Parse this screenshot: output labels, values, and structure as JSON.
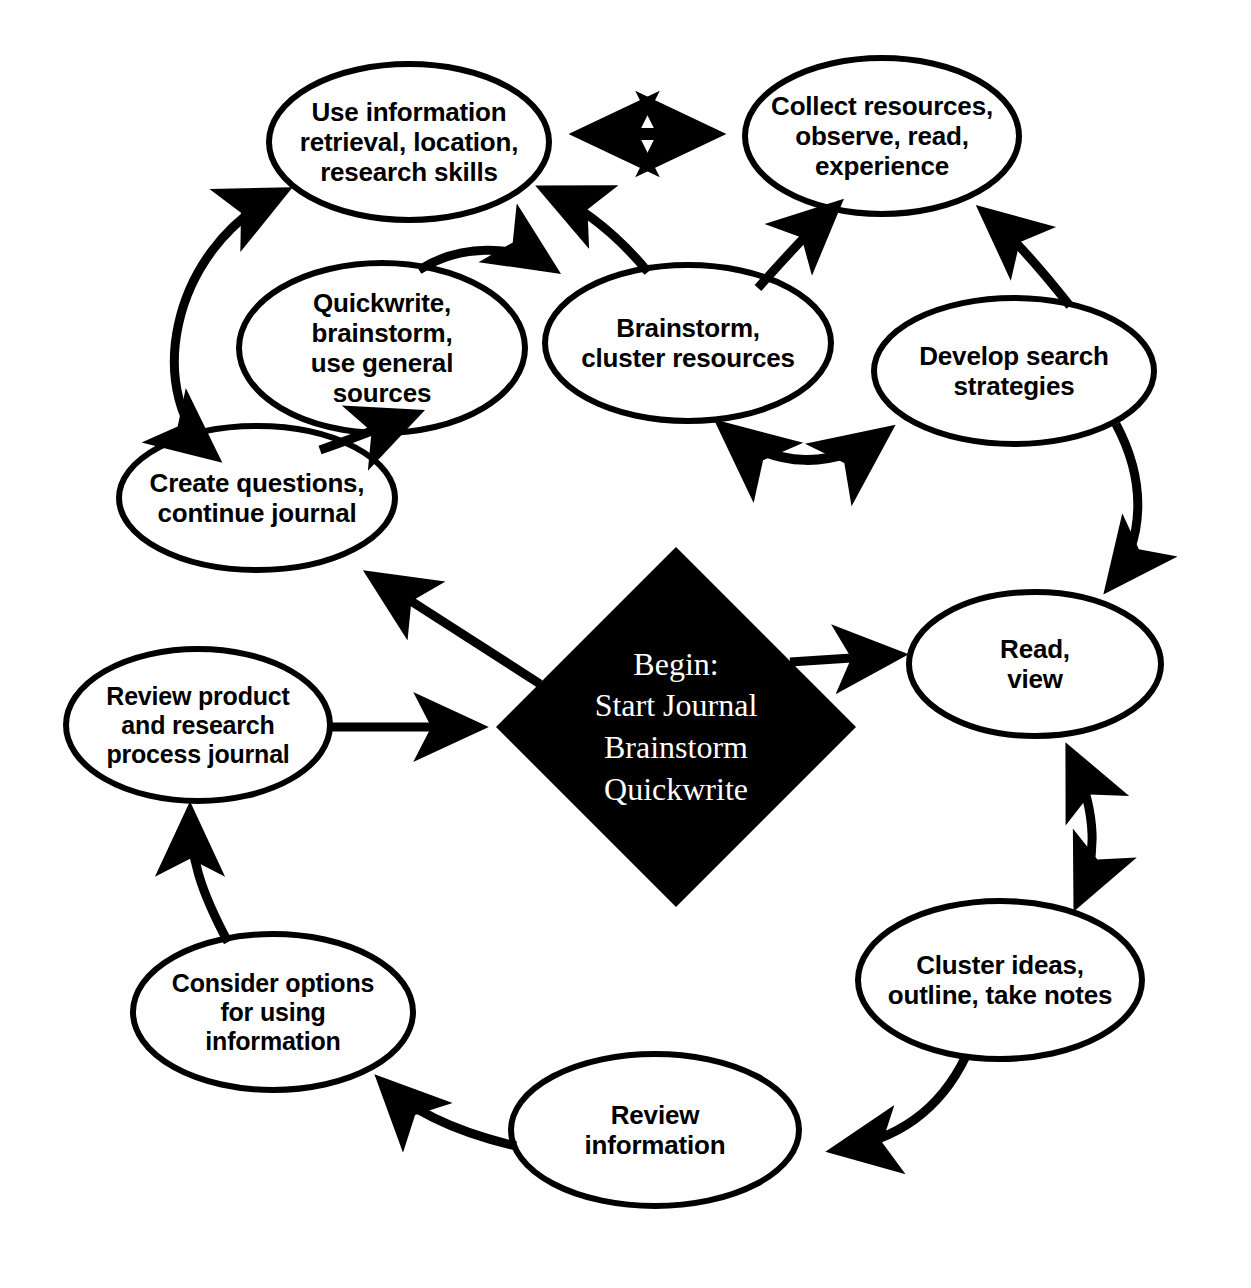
{
  "diagram": {
    "type": "cycle-flowchart",
    "background_color": "#ffffff",
    "stroke_color": "#000000",
    "center": {
      "shape": "diamond",
      "fill_color": "#000000",
      "text_color": "#ffffff",
      "lines": [
        "Begin:",
        "Start Journal",
        "Brainstorm",
        "Quickwrite"
      ],
      "text": "Begin:\nStart Journal\nBrainstorm\nQuickwrite"
    },
    "nodes": [
      {
        "id": "use-information",
        "text": "Use information\nretrieval, location,\nresearch skills",
        "lines": [
          "Use information",
          "retrieval, location,",
          "research skills"
        ],
        "shape": "ellipse",
        "cx": 409,
        "cy": 142,
        "rx": 140,
        "ry": 78
      },
      {
        "id": "collect-resources",
        "text": "Collect resources,\nobserve, read,\nexperience",
        "lines": [
          "Collect resources,",
          "observe, read,",
          "experience"
        ],
        "shape": "ellipse",
        "cx": 882,
        "cy": 136,
        "rx": 137,
        "ry": 78
      },
      {
        "id": "quickwrite",
        "text": "Quickwrite,\nbrainstorm,\nuse general\nsources",
        "lines": [
          "Quickwrite,",
          "brainstorm,",
          "use general",
          "sources"
        ],
        "shape": "ellipse",
        "cx": 382,
        "cy": 348,
        "rx": 143,
        "ry": 85
      },
      {
        "id": "brainstorm-cluster",
        "text": "Brainstorm,\ncluster resources",
        "lines": [
          "Brainstorm,",
          "cluster resources"
        ],
        "shape": "ellipse",
        "cx": 688,
        "cy": 343,
        "rx": 143,
        "ry": 78
      },
      {
        "id": "develop-search",
        "text": "Develop search\nstrategies",
        "lines": [
          "Develop search",
          "strategies"
        ],
        "shape": "ellipse",
        "cx": 1014,
        "cy": 371,
        "rx": 140,
        "ry": 73
      },
      {
        "id": "create-questions",
        "text": "Create questions,\ncontinue journal",
        "lines": [
          "Create questions,",
          "continue journal"
        ],
        "shape": "ellipse",
        "cx": 257,
        "cy": 498,
        "rx": 138,
        "ry": 72
      },
      {
        "id": "read-view",
        "text": "Read,\nview",
        "lines": [
          "Read,",
          "view"
        ],
        "shape": "ellipse",
        "cx": 1035,
        "cy": 664,
        "rx": 126,
        "ry": 72
      },
      {
        "id": "review-product",
        "text": "Review product\nand research\nprocess journal",
        "lines": [
          "Review product",
          "and research",
          "process journal"
        ],
        "shape": "ellipse",
        "cx": 198,
        "cy": 725,
        "rx": 132,
        "ry": 76
      },
      {
        "id": "cluster-ideas",
        "text": "Cluster ideas,\noutline, take notes",
        "lines": [
          "Cluster ideas,",
          "outline, take notes"
        ],
        "shape": "ellipse",
        "cx": 1000,
        "cy": 980,
        "rx": 142,
        "ry": 79
      },
      {
        "id": "consider-options",
        "text": "Consider options\nfor using\ninformation",
        "lines": [
          "Consider options",
          "for using",
          "information"
        ],
        "shape": "ellipse",
        "cx": 273,
        "cy": 1012,
        "rx": 140,
        "ry": 78
      },
      {
        "id": "review-information",
        "text": "Review\ninformation",
        "lines": [
          "Review",
          "information"
        ],
        "shape": "ellipse",
        "cx": 655,
        "cy": 1130,
        "rx": 144,
        "ry": 76
      }
    ],
    "edges": [
      {
        "id": "use-information--collect-resources",
        "from": "use-information",
        "to": "collect-resources",
        "arrow": "double",
        "style": "straight"
      },
      {
        "id": "use-information--create-questions",
        "from": "use-information",
        "to": "create-questions",
        "arrow": "double",
        "style": "curved"
      },
      {
        "id": "create-questions--quickwrite",
        "from": "create-questions",
        "to": "quickwrite",
        "arrow": "single",
        "style": "curved"
      },
      {
        "id": "quickwrite--brainstorm-cluster",
        "from": "quickwrite",
        "to": "brainstorm-cluster",
        "arrow": "single",
        "style": "curved"
      },
      {
        "id": "brainstorm-cluster--use-information",
        "from": "brainstorm-cluster",
        "to": "use-information",
        "arrow": "single",
        "style": "curved"
      },
      {
        "id": "brainstorm-cluster--collect-resources",
        "from": "brainstorm-cluster",
        "to": "collect-resources",
        "arrow": "single",
        "style": "curved"
      },
      {
        "id": "brainstorm-cluster--develop-search",
        "from": "brainstorm-cluster",
        "to": "develop-search",
        "arrow": "double",
        "style": "curved"
      },
      {
        "id": "develop-search--collect-resources",
        "from": "develop-search",
        "to": "collect-resources",
        "arrow": "single",
        "style": "curved"
      },
      {
        "id": "develop-search--read-view",
        "from": "develop-search",
        "to": "read-view",
        "arrow": "single",
        "style": "curved"
      },
      {
        "id": "center--create-questions",
        "from": "center",
        "to": "create-questions",
        "arrow": "single",
        "style": "straight"
      },
      {
        "id": "center--read-view",
        "from": "center",
        "to": "read-view",
        "arrow": "single",
        "style": "straight"
      },
      {
        "id": "review-product--center",
        "from": "review-product",
        "to": "center",
        "arrow": "single",
        "style": "straight"
      },
      {
        "id": "read-view--cluster-ideas",
        "from": "read-view",
        "to": "cluster-ideas",
        "arrow": "double",
        "style": "curved"
      },
      {
        "id": "cluster-ideas--review-information",
        "from": "cluster-ideas",
        "to": "review-information",
        "arrow": "single",
        "style": "curved"
      },
      {
        "id": "review-information--consider-options",
        "from": "review-information",
        "to": "consider-options",
        "arrow": "single",
        "style": "curved"
      },
      {
        "id": "consider-options--review-product",
        "from": "consider-options",
        "to": "review-product",
        "arrow": "single",
        "style": "curved"
      }
    ]
  }
}
